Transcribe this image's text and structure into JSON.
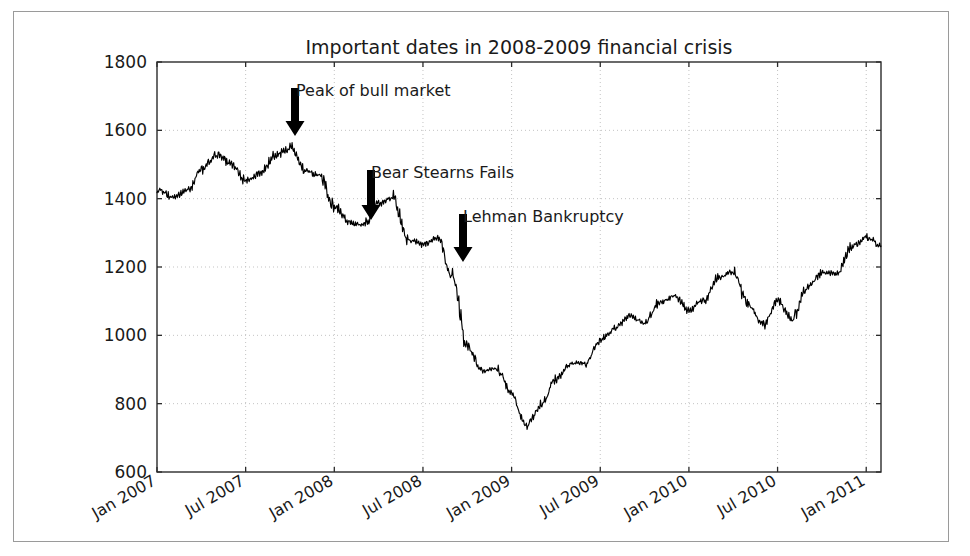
{
  "chart_data": {
    "type": "line",
    "title": "Important dates in 2008-2009 financial crisis",
    "xlabel": "",
    "ylabel": "",
    "ylim": [
      600,
      1800
    ],
    "yticks": [
      600,
      800,
      1000,
      1200,
      1400,
      1600,
      1800
    ],
    "ytick_labels": [
      "600",
      "800",
      "1000",
      "1200",
      "1400",
      "1600",
      "1800"
    ],
    "xlim": [
      "Jan 2007",
      "Feb 2011"
    ],
    "xticks": [
      "Jan 2007",
      "Jul 2007",
      "Jan 2008",
      "Jul 2008",
      "Jan 2009",
      "Jul 2009",
      "Jan 2010",
      "Jul 2010",
      "Jan 2011"
    ],
    "xtick_rotation_deg": 30,
    "grid": true,
    "grid_style": "dotted",
    "legend": "none",
    "series": [
      {
        "name": "S&P 500 index",
        "color": "#000000",
        "x": [
          "2007-01",
          "2007-02",
          "2007-03",
          "2007-04",
          "2007-05",
          "2007-06",
          "2007-07",
          "2007-08",
          "2007-09",
          "2007-10",
          "2007-11",
          "2007-12",
          "2008-01",
          "2008-02",
          "2008-03",
          "2008-04",
          "2008-05",
          "2008-06",
          "2008-07",
          "2008-08",
          "2008-09",
          "2008-10",
          "2008-11",
          "2008-12",
          "2009-01",
          "2009-02",
          "2009-03",
          "2009-04",
          "2009-05",
          "2009-06",
          "2009-07",
          "2009-08",
          "2009-09",
          "2009-10",
          "2009-11",
          "2009-12",
          "2010-01",
          "2010-02",
          "2010-03",
          "2010-04",
          "2010-05",
          "2010-06",
          "2010-07",
          "2010-08",
          "2010-09",
          "2010-10",
          "2010-11",
          "2010-12",
          "2011-01",
          "2011-02"
        ],
        "values": [
          1424,
          1407,
          1421,
          1482,
          1530,
          1503,
          1455,
          1474,
          1527,
          1549,
          1481,
          1468,
          1378,
          1330,
          1323,
          1386,
          1400,
          1280,
          1267,
          1283,
          1166,
          969,
          896,
          903,
          826,
          735,
          798,
          872,
          919,
          919,
          987,
          1021,
          1057,
          1036,
          1096,
          1115,
          1074,
          1104,
          1169,
          1187,
          1089,
          1031,
          1102,
          1049,
          1141,
          1183,
          1181,
          1258,
          1286,
          1261
        ]
      }
    ],
    "annotations": [
      {
        "id": "peak-of-bull-market",
        "label": "Peak of bull market",
        "date": "2007-10",
        "value": 1549,
        "arrow": "down",
        "text_x": 296,
        "text_y": 96,
        "arrow_x": 295,
        "arrow_top_y": 88,
        "arrow_tip_y": 136
      },
      {
        "id": "bear-stearns-fails",
        "label": "Bear Stearns Fails",
        "date": "2008-03",
        "value": 1323,
        "arrow": "down",
        "text_x": 371,
        "text_y": 178,
        "arrow_x": 371,
        "arrow_top_y": 170,
        "arrow_tip_y": 220
      },
      {
        "id": "lehman-bankruptcy",
        "label": "Lehman Bankruptcy",
        "date": "2008-09",
        "value": 1250,
        "arrow": "down",
        "text_x": 463,
        "text_y": 222,
        "arrow_x": 463,
        "arrow_top_y": 214,
        "arrow_tip_y": 262
      }
    ],
    "colors": {
      "line": "#000000",
      "axis": "#2b2b2b",
      "grid": "#c3c3c3",
      "background": "#ffffff",
      "frame": "#9a9a9a",
      "text": "#1a1a1a"
    }
  }
}
